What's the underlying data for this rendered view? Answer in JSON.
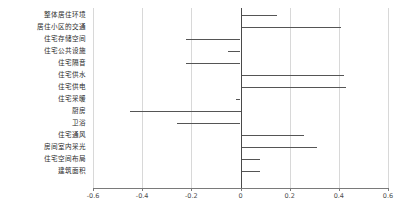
{
  "chart_data": {
    "type": "bar",
    "orientation": "horizontal",
    "title": "",
    "xlabel": "",
    "ylabel": "",
    "xlim": [
      -0.6,
      0.6
    ],
    "xticks": [
      -0.6,
      -0.4,
      -0.2,
      0,
      0.2,
      0.4,
      0.6
    ],
    "xticklabels": [
      "-0.6",
      "-0.4",
      "-0.2",
      "0",
      "0.2",
      "0.4",
      "0.6"
    ],
    "grid": true,
    "grid_axis": "x",
    "legend": "none",
    "zero_reference_line": 0,
    "bar_color": "#555555",
    "grid_color": "#d8d8d8",
    "axis_color": "#7a7a7a",
    "categories": [
      "整体居住环境",
      "居住小区的交通",
      "住宅存储空间",
      "住宅公共设施",
      "住宅隔音",
      "住宅供水",
      "住宅供电",
      "住宅采暖",
      "厨房",
      "卫浴",
      "住宅通风",
      "房间室内采光",
      "住宅空间布局",
      "建筑面积"
    ],
    "values": [
      0.15,
      0.41,
      -0.22,
      -0.05,
      -0.22,
      0.42,
      0.43,
      -0.02,
      -0.45,
      -0.26,
      0.26,
      0.31,
      0.08,
      0.08
    ]
  }
}
